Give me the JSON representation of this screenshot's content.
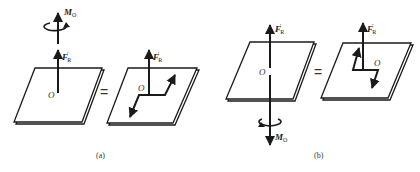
{
  "figure": {
    "panels": [
      {
        "id": "a",
        "caption": "(a)",
        "left": {
          "force_label": "F",
          "force_prime": "′",
          "force_sub": "R",
          "moment_label": "M",
          "moment_sub": "O",
          "origin_label": "O"
        },
        "equals": "=",
        "right": {
          "force_label": "F",
          "force_prime": "′",
          "force_sub": "R",
          "origin_label": "O"
        }
      },
      {
        "id": "b",
        "caption": "(b)",
        "left": {
          "force_label": "F",
          "force_prime": "′",
          "force_sub": "R",
          "moment_label": "M",
          "moment_sub": "O",
          "origin_label": "O"
        },
        "equals": "=",
        "right": {
          "force_label": "F",
          "force_prime": "′",
          "force_sub": "R",
          "origin_label": "O"
        }
      }
    ],
    "colors": {
      "stroke": "#1a1a1a",
      "background": "#ffffff"
    }
  }
}
